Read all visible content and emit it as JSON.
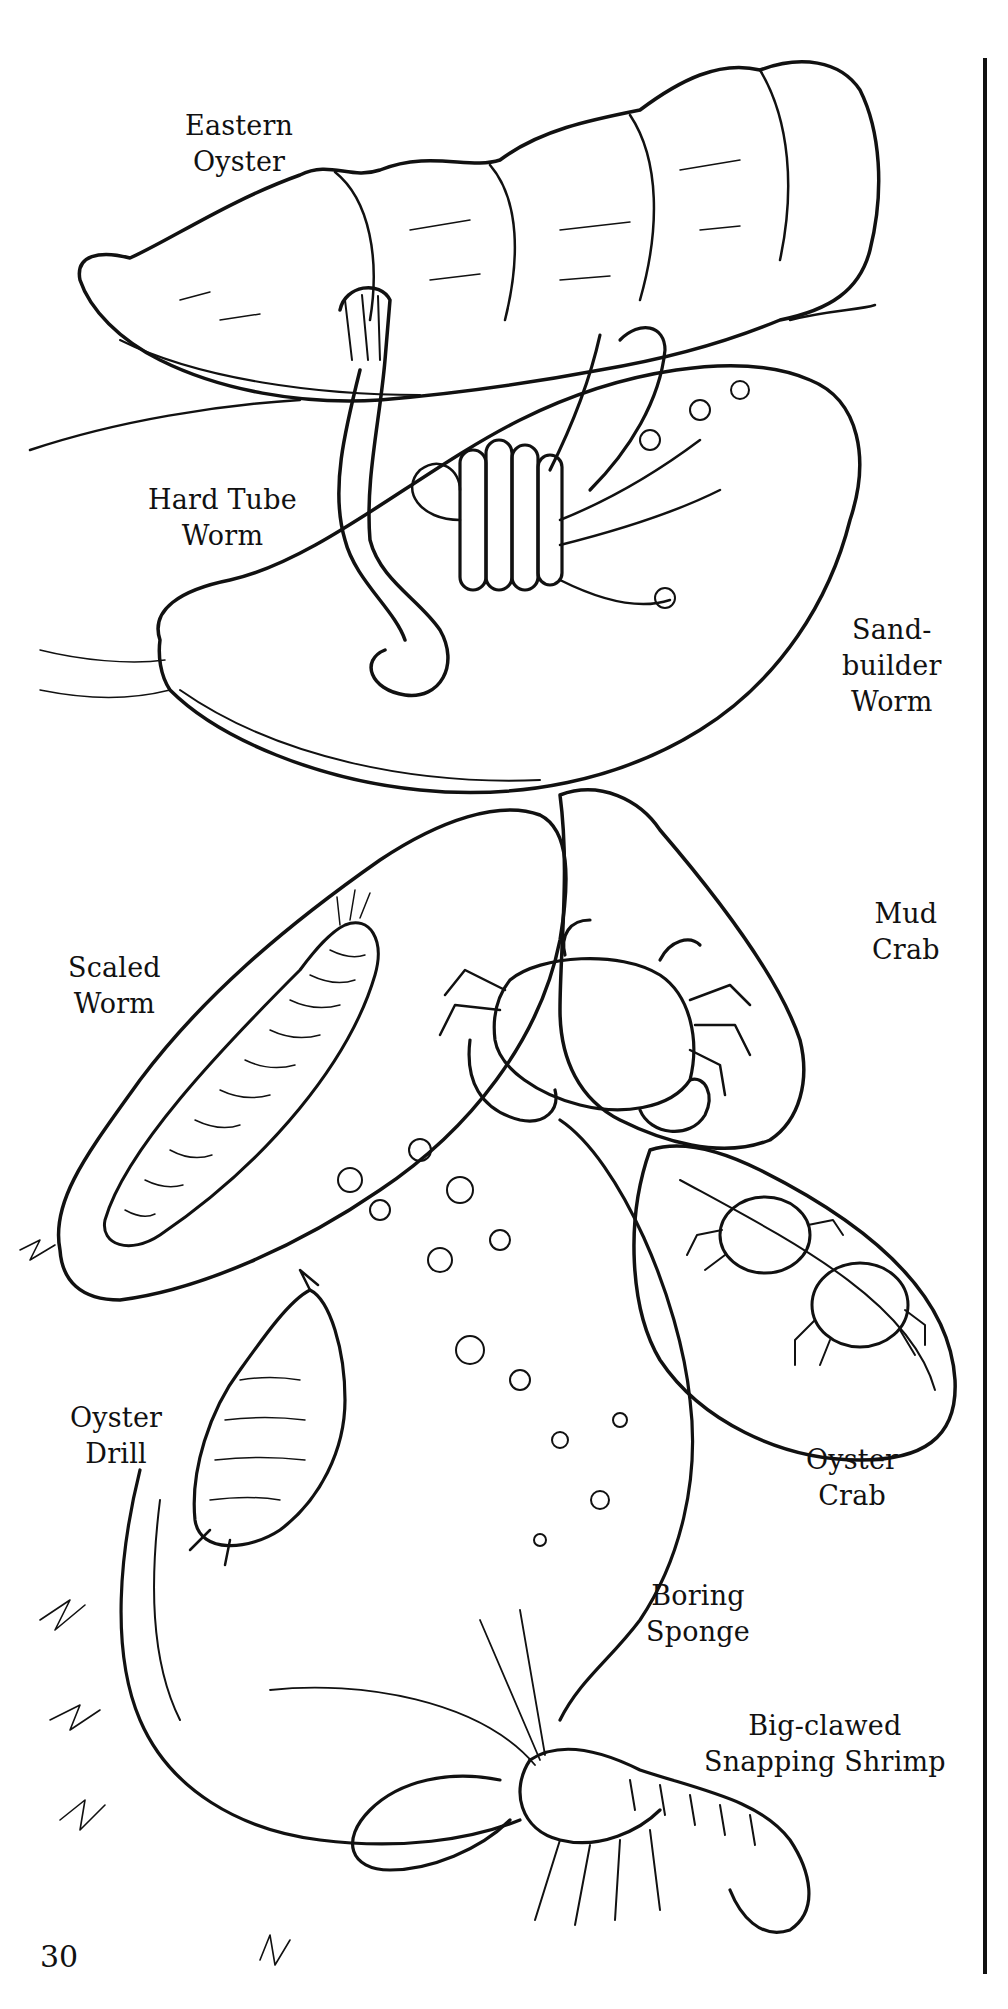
{
  "page": {
    "page_number": "30",
    "style": "black-and-white line illustration",
    "ink_color": "#111111",
    "background_color": "#ffffff"
  },
  "labels": [
    {
      "id": "eastern-oyster",
      "lines": [
        "Eastern",
        "Oyster"
      ]
    },
    {
      "id": "hard-tube-worm",
      "lines": [
        "Hard Tube",
        "Worm"
      ]
    },
    {
      "id": "sand-builder-worm",
      "lines": [
        "Sand-",
        "builder",
        "Worm"
      ]
    },
    {
      "id": "mud-crab",
      "lines": [
        "Mud",
        "Crab"
      ]
    },
    {
      "id": "scaled-worm",
      "lines": [
        "Scaled",
        "Worm"
      ]
    },
    {
      "id": "oyster-drill",
      "lines": [
        "Oyster",
        "Drill"
      ]
    },
    {
      "id": "oyster-crab",
      "lines": [
        "Oyster",
        "Crab"
      ]
    },
    {
      "id": "boring-sponge",
      "lines": [
        "Boring",
        "Sponge"
      ]
    },
    {
      "id": "snapping-shrimp",
      "lines": [
        "Big-clawed",
        "Snapping Shrimp"
      ]
    }
  ],
  "illustration": {
    "subjects": [
      "eastern oyster shell",
      "hard tube worm",
      "sand-builder worm colony",
      "mud crab",
      "scaled worm",
      "oyster drill snail",
      "oyster crabs",
      "boring sponge",
      "big-clawed snapping shrimp"
    ]
  }
}
